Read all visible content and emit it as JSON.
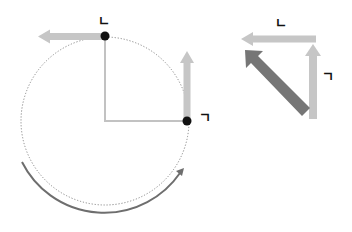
{
  "diagram": {
    "left": {
      "center": [
        105,
        121
      ],
      "radius": 84,
      "label_top": "ㄴ",
      "label_right": "ㄱ",
      "top_point": [
        105,
        36
      ],
      "right_point": [
        187,
        121
      ],
      "rotation_arrow": "counterclockwise-bottom-arc"
    },
    "right": {
      "label_top": "ㄴ",
      "label_right": "ㄱ",
      "resultant": "diagonal-arrow"
    },
    "colors": {
      "light_arrow": "#c4c4c4",
      "dark_arrow": "#777777",
      "arc": "#6e6e6e",
      "dot": "#111111",
      "dotted_circle": "#777777",
      "radius_line": "#bdbdbd"
    }
  }
}
